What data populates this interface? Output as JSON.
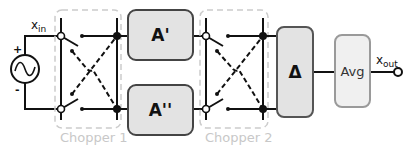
{
  "diagram": {
    "title": "",
    "source": {
      "label_main": "x",
      "label_sub": "in",
      "plus": "+",
      "minus": "-",
      "symbol": "ac-source-icon"
    },
    "chopper1": {
      "label": "Chopper 1"
    },
    "chopper2": {
      "label": "Chopper 2"
    },
    "blocks": {
      "a_prime": {
        "label": "A'"
      },
      "a_double_prime": {
        "label": "A''"
      },
      "delta": {
        "label": "Δ"
      },
      "avg": {
        "label": "Avg"
      }
    },
    "output": {
      "label_main": "x",
      "label_sub": "out"
    },
    "colors": {
      "block_fill": "#e3e3e3",
      "block_stroke": "#444444",
      "avg_fill": "#f0f0f0",
      "avg_stroke": "#9a9a9a",
      "chopper_box": "#cccccc",
      "chopper_label": "#c8c8c8",
      "wire": "#111111"
    }
  }
}
